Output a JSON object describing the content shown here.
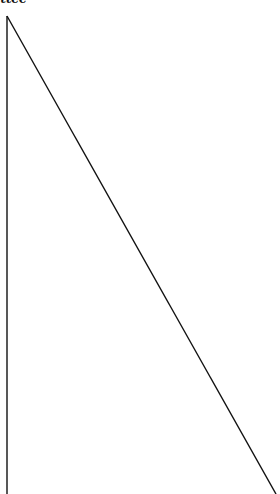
{
  "diagram": {
    "clipped_label": "ttee",
    "stroke_color": "#111111",
    "background": "#ffffff",
    "shape": "right-triangle-open-bottom",
    "apex": {
      "x": 7,
      "y": 16
    },
    "vertical_line_end": {
      "x": 7,
      "y": 494
    },
    "diagonal_line_end": {
      "x": 276,
      "y": 494
    }
  }
}
